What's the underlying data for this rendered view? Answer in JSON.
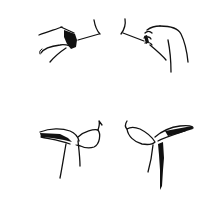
{
  "illustration": {
    "background": "#ffffff",
    "ink_color": "#111111",
    "panels": [
      {
        "id": "top-left",
        "description": "right hand pressing at left side of neck/collarbone"
      },
      {
        "id": "top-right",
        "description": "left hand pinching at right side of neck/collarbone"
      },
      {
        "id": "bottom-left",
        "description": "hand cupping underside of left breast from the side"
      },
      {
        "id": "bottom-right",
        "description": "hand cupping underside of right breast from the side"
      }
    ]
  }
}
